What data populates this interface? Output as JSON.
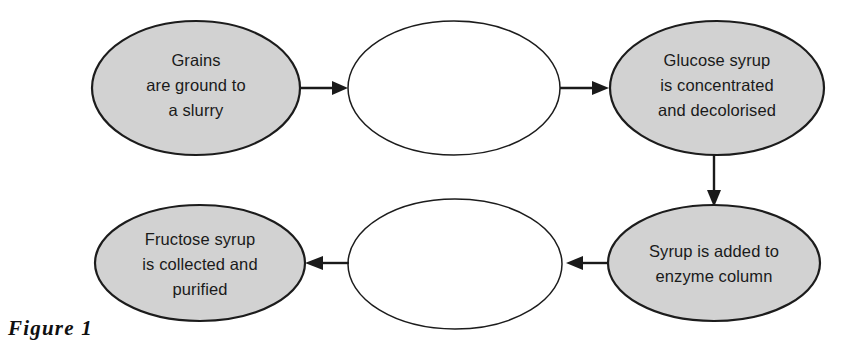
{
  "figure": {
    "caption": "Figure 1",
    "fill_color": "#d2d2d2",
    "stroke_color": "#1c1c1c",
    "background_color": "#ffffff",
    "text_color": "#1a1a1a"
  },
  "nodes": [
    {
      "id": "grains",
      "filled": true,
      "lines": [
        "Grains",
        "are ground to",
        "a slurry"
      ]
    },
    {
      "id": "blank-top-middle",
      "filled": false,
      "lines": []
    },
    {
      "id": "glucose-syrup",
      "filled": true,
      "lines": [
        "Glucose syrup",
        "is concentrated",
        "and decolorised"
      ]
    },
    {
      "id": "enzyme-column",
      "filled": true,
      "lines": [
        "Syrup is added to",
        "enzyme column"
      ]
    },
    {
      "id": "blank-bottom-middle",
      "filled": false,
      "lines": []
    },
    {
      "id": "fructose-syrup",
      "filled": true,
      "lines": [
        "Fructose syrup",
        "is collected and",
        "purified"
      ]
    }
  ],
  "connectors": [
    {
      "id": "grains-to-blank-top",
      "direction": "right"
    },
    {
      "id": "blank-top-to-glucose",
      "direction": "right"
    },
    {
      "id": "glucose-to-enzyme",
      "direction": "down"
    },
    {
      "id": "enzyme-to-blank-bottom",
      "direction": "left"
    },
    {
      "id": "blank-bottom-to-fructose",
      "direction": "left"
    }
  ]
}
